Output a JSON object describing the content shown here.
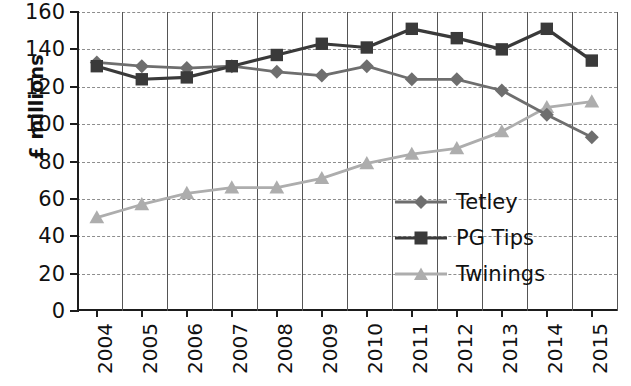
{
  "chart_data": {
    "type": "line",
    "title": "",
    "xlabel": "",
    "ylabel": "£ millions",
    "categories": [
      "2004",
      "2005",
      "2006",
      "2007",
      "2008",
      "2009",
      "2010",
      "2011",
      "2012",
      "2013",
      "2014",
      "2015"
    ],
    "ylim": [
      0,
      160
    ],
    "yticks": [
      0,
      20,
      40,
      60,
      80,
      100,
      120,
      140,
      160
    ],
    "grid": "horizontal-dashed-and-vertical-solid",
    "legend_position": "inside-center-right",
    "series": [
      {
        "name": "Tetley",
        "marker": "diamond",
        "color": "#6e6e6e",
        "values": [
          133,
          131,
          130,
          131,
          128,
          126,
          131,
          124,
          124,
          118,
          105,
          93
        ]
      },
      {
        "name": "PG Tips",
        "marker": "square",
        "color": "#3a3a3a",
        "values": [
          131,
          124,
          125,
          131,
          137,
          143,
          141,
          151,
          146,
          140,
          151,
          134
        ]
      },
      {
        "name": "Twinings",
        "marker": "triangle",
        "color": "#adadad",
        "values": [
          50,
          57,
          63,
          66,
          66,
          71,
          79,
          84,
          87,
          96,
          109,
          112
        ]
      }
    ]
  },
  "legend": {
    "items": [
      {
        "label": "Tetley"
      },
      {
        "label": "PG Tips"
      },
      {
        "label": "Twinings"
      }
    ]
  }
}
